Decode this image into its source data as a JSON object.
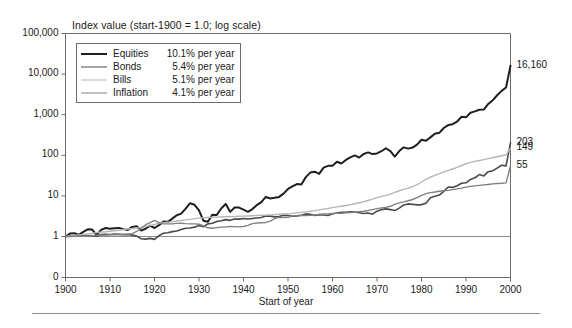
{
  "figure": {
    "title": "Index value (start-1900 = 1.0; log scale)",
    "xaxis_title": "Start of year"
  },
  "legend": {
    "items": [
      {
        "label": "Equities",
        "rate": "10.1%",
        "rate_suffix": "per year",
        "color": "#1f1f1f",
        "width": 2.0
      },
      {
        "label": "Bonds",
        "rate": "5.4%",
        "rate_suffix": "per year",
        "color": "#4a4a4a",
        "width": 1.6
      },
      {
        "label": "Bills",
        "rate": "5.1%",
        "rate_suffix": "per year",
        "color": "#b5b5b5",
        "width": 1.4
      },
      {
        "label": "Inflation",
        "rate": "4.1%",
        "rate_suffix": "per year",
        "color": "#808080",
        "width": 1.4
      }
    ]
  },
  "end_labels": [
    {
      "series": "Equities",
      "value": "16,160"
    },
    {
      "series": "Bonds",
      "value": "203"
    },
    {
      "series": "Bills",
      "value": "149"
    },
    {
      "series": "Inflation",
      "value": "55"
    }
  ],
  "chart_data": {
    "type": "line",
    "title": "Index value (start-1900 = 1.0; log scale)",
    "xlabel": "Start of year",
    "ylabel": "Index value (start-1900 = 1.0; log scale)",
    "yscale": "log",
    "ylim": [
      1,
      100000
    ],
    "xlim": [
      1900,
      2000
    ],
    "grid": false,
    "legend_position": "top-left-inside",
    "yticks": [
      "100,000",
      "10,000",
      "1,000",
      "100",
      "10",
      "1",
      "0"
    ],
    "ytick_values": [
      100000,
      10000,
      1000,
      100,
      10,
      1,
      0
    ],
    "xticks": [
      "1900",
      "1910",
      "1920",
      "1930",
      "1940",
      "1950",
      "1960",
      "1970",
      "1980",
      "1990",
      "2000"
    ],
    "xtick_values": [
      1900,
      1910,
      1920,
      1930,
      1940,
      1950,
      1960,
      1970,
      1980,
      1990,
      2000
    ],
    "reference_line": {
      "y": 1,
      "label": "1.0"
    },
    "annotations": [
      {
        "text": "16,160",
        "x": 2000,
        "y": 16160,
        "series": "Equities"
      },
      {
        "text": "203",
        "x": 2000,
        "y": 203,
        "series": "Bonds"
      },
      {
        "text": "149",
        "x": 2000,
        "y": 149,
        "series": "Bills"
      },
      {
        "text": "55",
        "x": 2000,
        "y": 55,
        "series": "Inflation"
      }
    ],
    "x": [
      1900,
      1901,
      1902,
      1903,
      1904,
      1905,
      1906,
      1907,
      1908,
      1909,
      1910,
      1911,
      1912,
      1913,
      1914,
      1915,
      1916,
      1917,
      1918,
      1919,
      1920,
      1921,
      1922,
      1923,
      1924,
      1925,
      1926,
      1927,
      1928,
      1929,
      1930,
      1931,
      1932,
      1933,
      1934,
      1935,
      1936,
      1937,
      1938,
      1939,
      1940,
      1941,
      1942,
      1943,
      1944,
      1945,
      1946,
      1947,
      1948,
      1949,
      1950,
      1951,
      1952,
      1953,
      1954,
      1955,
      1956,
      1957,
      1958,
      1959,
      1960,
      1961,
      1962,
      1963,
      1964,
      1965,
      1966,
      1967,
      1968,
      1969,
      1970,
      1971,
      1972,
      1973,
      1974,
      1975,
      1976,
      1977,
      1978,
      1979,
      1980,
      1981,
      1982,
      1983,
      1984,
      1985,
      1986,
      1987,
      1988,
      1989,
      1990,
      1991,
      1992,
      1993,
      1994,
      1995,
      1996,
      1997,
      1998,
      1999,
      2000
    ],
    "series": [
      {
        "name": "Equities",
        "annualized_return": "10.1% per year",
        "end_value": 16160,
        "color": "#1f1f1f",
        "values": [
          1.0,
          1.18,
          1.21,
          1.1,
          1.3,
          1.5,
          1.48,
          1.08,
          1.45,
          1.62,
          1.55,
          1.6,
          1.63,
          1.52,
          1.45,
          1.72,
          1.78,
          1.4,
          1.55,
          1.85,
          1.62,
          1.9,
          2.35,
          2.3,
          2.75,
          3.35,
          3.65,
          4.85,
          6.6,
          6.05,
          4.4,
          2.45,
          2.3,
          3.45,
          3.4,
          4.9,
          6.35,
          4.05,
          5.2,
          5.15,
          4.6,
          4.05,
          4.75,
          5.95,
          7.05,
          9.45,
          8.6,
          9.0,
          9.45,
          11.4,
          14.8,
          17.1,
          19.5,
          19.2,
          29.0,
          37.5,
          39.5,
          34.8,
          49.5,
          55.0,
          55.0,
          69.5,
          63.0,
          77.0,
          89.0,
          99.5,
          88.0,
          108.0,
          118.0,
          107.0,
          111.0,
          126.0,
          149.0,
          127.0,
          93.0,
          127.0,
          157.0,
          146.0,
          155.0,
          183.0,
          241.0,
          229.0,
          277.0,
          338.0,
          358.0,
          470.0,
          555.0,
          583.0,
          678.0,
          890.0,
          861.0,
          1120.0,
          1205.0,
          1325.0,
          1340.0,
          1840.0,
          2260.0,
          3010.0,
          3865.0,
          4670.0,
          16160.0
        ]
      },
      {
        "name": "Bonds",
        "annualized_return": "5.4% per year",
        "end_value": 203,
        "color": "#4a4a4a",
        "values": [
          1.0,
          1.02,
          1.05,
          1.03,
          1.08,
          1.06,
          1.04,
          1.02,
          1.12,
          1.14,
          1.12,
          1.15,
          1.13,
          1.1,
          1.12,
          1.08,
          1.02,
          0.88,
          0.86,
          0.9,
          0.85,
          1.05,
          1.2,
          1.24,
          1.32,
          1.36,
          1.48,
          1.6,
          1.62,
          1.7,
          1.86,
          1.74,
          2.05,
          2.12,
          2.35,
          2.45,
          2.6,
          2.5,
          2.7,
          2.68,
          2.78,
          2.7,
          2.78,
          2.86,
          2.95,
          3.2,
          3.18,
          3.05,
          3.12,
          3.35,
          3.3,
          3.15,
          3.22,
          3.35,
          3.6,
          3.52,
          3.3,
          3.45,
          3.38,
          3.3,
          3.65,
          3.78,
          3.92,
          3.95,
          4.05,
          4.0,
          3.85,
          3.7,
          3.78,
          3.55,
          4.2,
          4.6,
          4.8,
          4.6,
          4.35,
          5.0,
          6.0,
          6.35,
          6.2,
          6.0,
          6.1,
          6.6,
          9.0,
          9.8,
          10.5,
          13.0,
          16.5,
          16.2,
          17.8,
          20.5,
          21.0,
          25.5,
          28.0,
          33.5,
          31.0,
          39.5,
          41.5,
          48.5,
          57.0,
          55.0,
          203.0
        ]
      },
      {
        "name": "Bills",
        "annualized_return": "5.1% per year",
        "end_value": 149,
        "color": "#b5b5b5",
        "values": [
          1.0,
          1.03,
          1.06,
          1.09,
          1.12,
          1.16,
          1.2,
          1.25,
          1.28,
          1.31,
          1.35,
          1.39,
          1.43,
          1.48,
          1.53,
          1.57,
          1.62,
          1.68,
          1.76,
          1.85,
          1.98,
          2.1,
          2.18,
          2.25,
          2.32,
          2.4,
          2.48,
          2.56,
          2.65,
          2.76,
          2.84,
          2.9,
          2.94,
          2.97,
          3.0,
          3.03,
          3.06,
          3.09,
          3.12,
          3.15,
          3.18,
          3.21,
          3.25,
          3.29,
          3.33,
          3.37,
          3.41,
          3.46,
          3.52,
          3.58,
          3.65,
          3.72,
          3.82,
          3.94,
          4.05,
          4.18,
          4.34,
          4.54,
          4.72,
          4.9,
          5.15,
          5.35,
          5.58,
          5.82,
          6.1,
          6.42,
          6.8,
          7.2,
          7.7,
          8.3,
          9.1,
          9.7,
          10.3,
          11.1,
          12.2,
          13.4,
          14.5,
          15.6,
          17.0,
          19.0,
          22.0,
          25.5,
          29.0,
          32.0,
          35.5,
          39.0,
          42.5,
          46.0,
          50.5,
          56.0,
          62.0,
          67.0,
          71.0,
          74.5,
          78.0,
          82.5,
          87.0,
          92.0,
          97.5,
          103.0,
          149.0
        ]
      },
      {
        "name": "Inflation",
        "annualized_return": "4.1% per year",
        "end_value": 55,
        "color": "#808080",
        "values": [
          1.0,
          1.0,
          1.01,
          1.02,
          1.02,
          1.03,
          1.04,
          1.07,
          1.08,
          1.08,
          1.1,
          1.1,
          1.12,
          1.14,
          1.15,
          1.18,
          1.33,
          1.6,
          1.95,
          2.2,
          2.5,
          2.2,
          2.05,
          2.05,
          2.05,
          2.1,
          2.12,
          2.07,
          2.05,
          2.05,
          2.0,
          1.82,
          1.64,
          1.6,
          1.65,
          1.7,
          1.72,
          1.78,
          1.75,
          1.73,
          1.76,
          1.88,
          2.08,
          2.15,
          2.18,
          2.22,
          2.4,
          2.75,
          2.96,
          2.93,
          2.96,
          3.19,
          3.26,
          3.28,
          3.3,
          3.31,
          3.37,
          3.48,
          3.57,
          3.61,
          3.67,
          3.71,
          3.75,
          3.82,
          3.88,
          3.95,
          4.07,
          4.18,
          4.36,
          4.59,
          4.86,
          5.07,
          5.23,
          5.55,
          6.17,
          6.73,
          7.12,
          7.58,
          8.16,
          9.08,
          10.3,
          11.37,
          12.06,
          12.44,
          12.98,
          13.44,
          13.7,
          14.28,
          14.88,
          15.59,
          16.44,
          17.13,
          17.65,
          18.17,
          18.64,
          19.17,
          19.74,
          20.19,
          20.5,
          20.95,
          55.0
        ]
      }
    ]
  }
}
